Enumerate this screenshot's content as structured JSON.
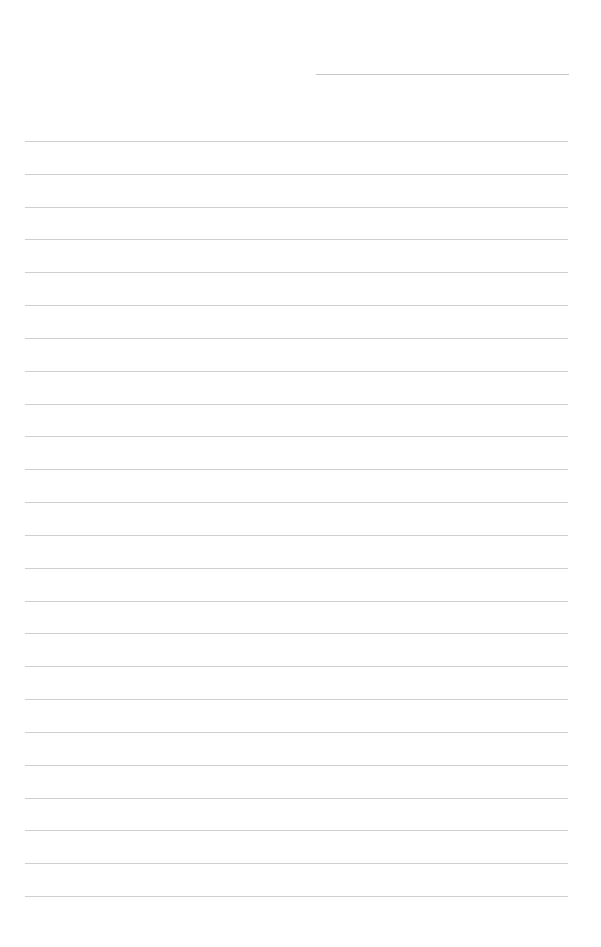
{
  "page": {
    "type": "blank lined writing paper",
    "background_color": "#ffffff",
    "line_color": "#cfcfcf",
    "header_line": {
      "present": true,
      "text": ""
    },
    "ruled_lines": {
      "count": 24,
      "first_y": 141,
      "pitch": 32.83,
      "text": []
    }
  }
}
